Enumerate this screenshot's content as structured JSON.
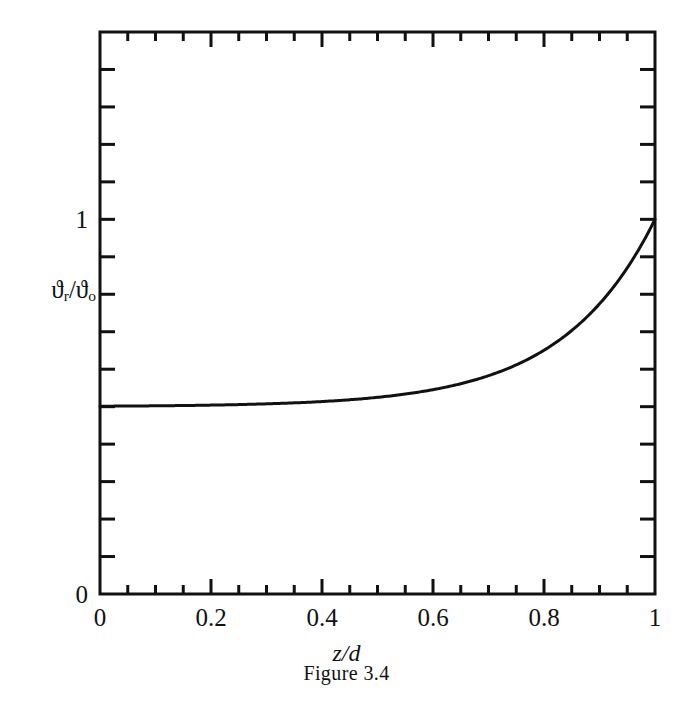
{
  "figure": {
    "caption": "Figure 3.4",
    "ylabel_main": "ϑ",
    "ylabel_sub1": "r",
    "ylabel_slash": "/ϑ",
    "ylabel_sub2": "o",
    "ylabel_plain": "ϑr/ϑo",
    "xlabel": "z/d"
  },
  "chart_data": {
    "type": "line",
    "title": "Figure 3.4",
    "xlabel": "z/d",
    "ylabel": "ϑr/ϑo",
    "xlim": [
      0,
      1
    ],
    "ylim": [
      0,
      1.5
    ],
    "grid": false,
    "legend": null,
    "x_ticks_major": [
      0,
      0.2,
      0.4,
      0.6,
      0.8,
      1
    ],
    "x_tick_labels": [
      "0",
      "0.2",
      "0.4",
      "0.6",
      "0.8",
      "1"
    ],
    "x_tick_minor_step": 0.05,
    "y_ticks_labeled": [
      0,
      1
    ],
    "y_tick_labels": [
      "0",
      "1"
    ],
    "y_tick_minor_step": 0.1,
    "series": [
      {
        "name": "ϑr/ϑo",
        "formula": "0.5 + 0.5*exp(6*(x-1))",
        "x": [
          0,
          0.05,
          0.1,
          0.15,
          0.2,
          0.25,
          0.3,
          0.35,
          0.4,
          0.45,
          0.5,
          0.55,
          0.6,
          0.65,
          0.7,
          0.75,
          0.8,
          0.85,
          0.9,
          0.95,
          1
        ],
        "values": [
          0.501,
          0.502,
          0.502,
          0.503,
          0.503,
          0.504,
          0.506,
          0.508,
          0.511,
          0.515,
          0.525,
          0.533,
          0.547,
          0.568,
          0.6,
          0.639,
          0.701,
          0.703,
          0.786,
          0.87,
          1.0
        ]
      }
    ]
  },
  "plot_geometry": {
    "left_px": 100,
    "right_px": 655,
    "top_px": 32,
    "bottom_px": 594
  }
}
